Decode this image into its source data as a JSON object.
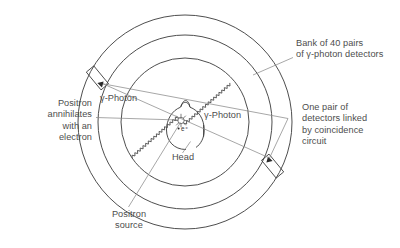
{
  "diagram": {
    "colors": {
      "ink": "#3a3a3a",
      "text": "#4d4d4d",
      "leader": "#8a8a8a",
      "background": "#ffffff"
    },
    "labels": {
      "bank_of_detectors": "Bank of 40 pairs\nof γ-photon detectors",
      "one_pair": "One pair of\ndetectors linked\nby coincidence\ncircuit",
      "positron_annihilates": "Positron\nannihilates\nwith an\nelectron",
      "gamma_photon_left": "γ-Photon",
      "gamma_photon_right": "γ-Photon",
      "head": "Head",
      "positron_source": "Positron\nsource",
      "positron_symbol": "e⁺"
    }
  }
}
